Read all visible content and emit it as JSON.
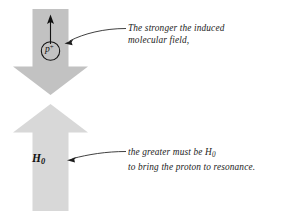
{
  "figure": {
    "background_color": "#ffffff",
    "width": 289,
    "height": 211
  },
  "arrows": {
    "induced_field_arrow": {
      "name": "induced-molecular-field-arrow",
      "direction": "down",
      "fill_color": "#c2c2c2",
      "description": "Large gray arrow pointing downward representing the induced molecular field"
    },
    "applied_field_arrow": {
      "name": "applied-field-arrow",
      "direction": "up",
      "fill_color": "#d8d8d8",
      "label": "H",
      "label_subscript": "0",
      "description": "Large light gray arrow pointing upward representing the applied field H0"
    },
    "spin_vector_arrow": {
      "name": "proton-spin-vector-arrow",
      "direction": "up",
      "stroke_color": "#111111",
      "description": "Small black arrow above the proton indicating the nuclear magnetic moment"
    }
  },
  "proton": {
    "symbol": "p",
    "charge": "+",
    "circle_stroke_color": "#111111"
  },
  "annotations": {
    "top": {
      "line1": "The stronger the induced",
      "line2": "molecular field,",
      "leader_target": "proton"
    },
    "bottom": {
      "line1_prefix": "the greater must be ",
      "line1_symbol": "H",
      "line1_subscript": "0",
      "line2": "to bring the proton to resonance.",
      "leader_target": "applied-field-arrow"
    }
  },
  "colors": {
    "text": "#1b1b1b",
    "leader_line": "#1d1d1d",
    "dark_arrow": "#c2c2c2",
    "light_arrow": "#d8d8d8"
  }
}
